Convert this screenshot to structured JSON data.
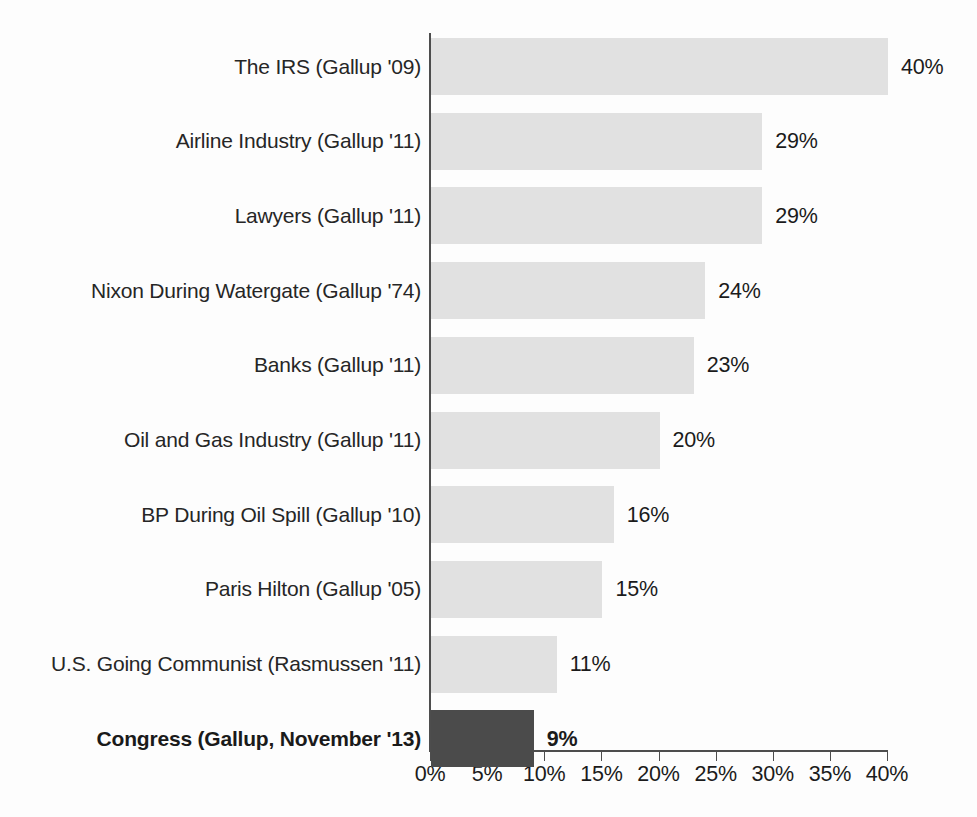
{
  "chart_data": {
    "type": "bar",
    "orientation": "horizontal",
    "title": "",
    "subtitle": "",
    "xlabel": "",
    "ylabel": "",
    "xlim": [
      0,
      40
    ],
    "grid": false,
    "legend": false,
    "tick_labels": [
      "0%",
      "5%",
      "10%",
      "15%",
      "20%",
      "25%",
      "30%",
      "35%",
      "40%"
    ],
    "tick_values": [
      0,
      5,
      10,
      15,
      20,
      25,
      30,
      35,
      40
    ],
    "categories": [
      "The IRS (Gallup '09)",
      "Airline Industry (Gallup '11)",
      "Lawyers (Gallup '11)",
      "Nixon During Watergate (Gallup '74)",
      "Banks (Gallup '11)",
      "Oil and Gas Industry (Gallup '11)",
      "BP During Oil Spill (Gallup '10)",
      "Paris Hilton (Gallup '05)",
      "U.S. Going Communist (Rasmussen '11)",
      "Congress (Gallup, November '13)"
    ],
    "values": [
      40,
      29,
      29,
      24,
      23,
      20,
      16,
      15,
      11,
      9
    ],
    "value_labels": [
      "40%",
      "29%",
      "29%",
      "24%",
      "23%",
      "20%",
      "16%",
      "15%",
      "11%",
      "9%"
    ],
    "highlight_index": 9,
    "colors": {
      "bar": "#e1e1e1",
      "bar_highlight": "#4b4b4b",
      "axis": "#4d4d4d",
      "text": "#1b1b1b",
      "background": "#fdfdfd"
    }
  }
}
